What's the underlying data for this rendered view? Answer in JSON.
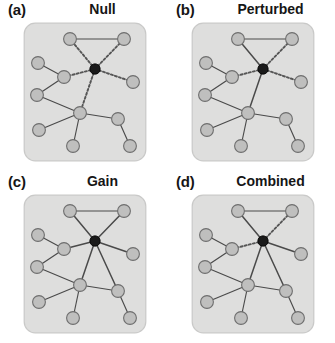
{
  "figure": {
    "panels": [
      {
        "letter": "(a)",
        "title": "Null",
        "id": "panel-a",
        "hub_edge_styles": [
          "dashed",
          "dashed",
          "dashed",
          "dashed",
          "dashed",
          "none"
        ]
      },
      {
        "letter": "(b)",
        "title": "Perturbed",
        "id": "panel-b",
        "hub_edge_styles": [
          "solid",
          "dashed",
          "dashed",
          "dashed",
          "solid",
          "none"
        ]
      },
      {
        "letter": "(c)",
        "title": "Gain",
        "id": "panel-c",
        "hub_edge_styles": [
          "solid",
          "solid",
          "solid",
          "solid",
          "solid",
          "solid"
        ]
      },
      {
        "letter": "(d)",
        "title": "Combined",
        "id": "panel-d",
        "hub_edge_styles": [
          "solid",
          "dashed",
          "dashed",
          "solid",
          "solid",
          "solid"
        ]
      }
    ]
  },
  "network": {
    "node_radius": 6.4,
    "hub_radius": 5.2,
    "nodes": [
      {
        "id": "hub",
        "x": 72,
        "y": 47,
        "type": "hub"
      },
      {
        "id": "n1",
        "x": 47,
        "y": 17,
        "type": "normal"
      },
      {
        "id": "n2",
        "x": 101,
        "y": 17,
        "type": "normal"
      },
      {
        "id": "n3",
        "x": 15,
        "y": 41,
        "type": "normal"
      },
      {
        "id": "n4",
        "x": 41,
        "y": 55,
        "type": "normal"
      },
      {
        "id": "n5",
        "x": 14,
        "y": 73,
        "type": "normal"
      },
      {
        "id": "n6",
        "x": 110,
        "y": 60,
        "type": "normal"
      },
      {
        "id": "n7",
        "x": 57,
        "y": 91,
        "type": "normal"
      },
      {
        "id": "n8",
        "x": 16,
        "y": 108,
        "type": "normal"
      },
      {
        "id": "n9",
        "x": 50,
        "y": 124,
        "type": "normal"
      },
      {
        "id": "n10",
        "x": 95,
        "y": 97,
        "type": "normal"
      },
      {
        "id": "n11",
        "x": 107,
        "y": 124,
        "type": "normal"
      }
    ],
    "hub_edges": [
      {
        "from": "hub",
        "to": "n1"
      },
      {
        "from": "hub",
        "to": "n2"
      },
      {
        "from": "hub",
        "to": "n4"
      },
      {
        "from": "hub",
        "to": "n6"
      },
      {
        "from": "hub",
        "to": "n7"
      },
      {
        "from": "hub",
        "to": "n10"
      }
    ],
    "base_edges": [
      {
        "from": "n1",
        "to": "n2"
      },
      {
        "from": "n3",
        "to": "n4"
      },
      {
        "from": "n4",
        "to": "n5"
      },
      {
        "from": "n5",
        "to": "n7"
      },
      {
        "from": "n7",
        "to": "n8"
      },
      {
        "from": "n7",
        "to": "n9"
      },
      {
        "from": "n7",
        "to": "n10"
      },
      {
        "from": "n10",
        "to": "n11"
      }
    ]
  },
  "style": {
    "panel_background": "#dededd",
    "panel_border": "#c9c9c8",
    "node_fill": "#bfbfbe",
    "node_stroke": "#6e6e6e",
    "hub_fill": "#1a1a1a",
    "hub_stroke": "#000000",
    "edge_color": "#4a4a4a",
    "dashed_edge_color": "#555555",
    "text_color": "#161616"
  }
}
